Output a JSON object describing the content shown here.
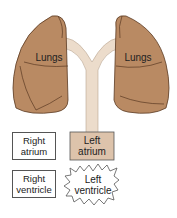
{
  "diagram": {
    "lungs_left_label": "Lungs",
    "lungs_right_label": "Lungs",
    "right_atrium": [
      "Right",
      "atrium"
    ],
    "left_atrium": [
      "Left",
      "atrium"
    ],
    "right_ventricle": [
      "Right",
      "ventricle"
    ],
    "left_ventricle": [
      "Left",
      "ventricle"
    ],
    "colors": {
      "lung_fill": "#b98a63",
      "lung_outline": "#5a3a22",
      "vessel_fill": "#ecdccb",
      "left_atrium_fill": "#ddc3ab",
      "box_border": "#555555"
    }
  }
}
